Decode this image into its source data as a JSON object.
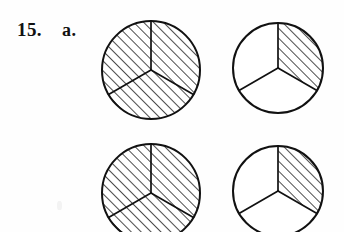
{
  "exercise": {
    "number_label": "15.",
    "part_label": "a."
  },
  "figure": {
    "sector_count": 3,
    "hatch_angle_degrees": 45,
    "hatch_spacing_px": 7,
    "stroke_color": "#111111",
    "fill_color": "#ffffff",
    "circles": [
      {
        "name": "top-left-circle",
        "position": "top-left",
        "cx": 151,
        "cy": 70,
        "r": 49,
        "shaded_sectors": [
          0,
          1,
          2
        ],
        "shaded_count": 3,
        "fraction": "3/3"
      },
      {
        "name": "top-right-circle",
        "position": "top-right",
        "cx": 278,
        "cy": 68,
        "r": 45,
        "shaded_sectors": [
          0
        ],
        "shaded_count": 1,
        "fraction": "1/3"
      },
      {
        "name": "bottom-left-circle",
        "position": "bottom-left",
        "cx": 151,
        "cy": 193,
        "r": 49,
        "shaded_sectors": [
          0,
          1,
          2
        ],
        "shaded_count": 3,
        "fraction": "3/3"
      },
      {
        "name": "bottom-right-circle",
        "position": "bottom-right",
        "cx": 278,
        "cy": 191,
        "r": 45,
        "shaded_sectors": [
          0
        ],
        "shaded_count": 1,
        "fraction": "1/3"
      }
    ]
  }
}
